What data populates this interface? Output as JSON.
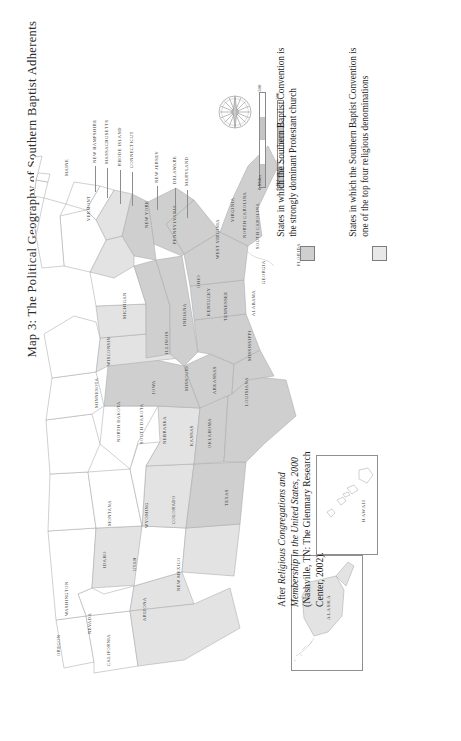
{
  "title": {
    "prefix": "Map 3:",
    "text": "The Political Geography of Southern Baptist Adherents",
    "full": "Map 3: The Political Geography of Southern Baptist Adherents"
  },
  "legend": {
    "items": [
      {
        "swatch_color": "#cfcfcf",
        "label": "States in which the Southern Baptist Convention is the strongly dominant Protestant church"
      },
      {
        "swatch_color": "#e8e8e8",
        "label": "States in which the Southern Baptist Convention is one of the top four religious denominations"
      }
    ]
  },
  "scale": {
    "miles": {
      "zero": "0 Miles",
      "max": "500"
    },
    "kilometers": {
      "zero": "0 Kilometers",
      "max": "500"
    }
  },
  "compass": {
    "name": "compass-rose"
  },
  "insets": [
    {
      "id": "alaska",
      "label": "Alaska"
    },
    {
      "id": "hawaii",
      "label": "Hawaii"
    }
  ],
  "source": {
    "line1_prefix": "After ",
    "line1_italic": "Religious Congregations and Membership in the United States, 2000",
    "line2": " (Nashville, TN: The Glenmary Research Center, 2002)."
  },
  "map_data": {
    "type": "choropleth",
    "region": "United States",
    "classes": [
      {
        "name": "strongly-dominant",
        "color": "#cfcfcf"
      },
      {
        "name": "top-four-denomination",
        "color": "#e3e3e3"
      },
      {
        "name": "none",
        "color": "#ffffff"
      }
    ],
    "states": [
      {
        "name": "Washington",
        "class": "none"
      },
      {
        "name": "Oregon",
        "class": "none"
      },
      {
        "name": "Idaho",
        "class": "none"
      },
      {
        "name": "Montana",
        "class": "none"
      },
      {
        "name": "Wyoming",
        "class": "top-four-denomination"
      },
      {
        "name": "Nevada",
        "class": "top-four-denomination"
      },
      {
        "name": "California",
        "class": "top-four-denomination"
      },
      {
        "name": "Utah",
        "class": "none"
      },
      {
        "name": "Arizona",
        "class": "top-four-denomination"
      },
      {
        "name": "Colorado",
        "class": "top-four-denomination"
      },
      {
        "name": "New Mexico",
        "class": "strongly-dominant"
      },
      {
        "name": "North Dakota",
        "class": "none"
      },
      {
        "name": "South Dakota",
        "class": "none"
      },
      {
        "name": "Nebraska",
        "class": "none"
      },
      {
        "name": "Kansas",
        "class": "top-four-denomination"
      },
      {
        "name": "Oklahoma",
        "class": "strongly-dominant"
      },
      {
        "name": "Texas",
        "class": "strongly-dominant"
      },
      {
        "name": "Minnesota",
        "class": "none"
      },
      {
        "name": "Iowa",
        "class": "none"
      },
      {
        "name": "Missouri",
        "class": "strongly-dominant"
      },
      {
        "name": "Arkansas",
        "class": "strongly-dominant"
      },
      {
        "name": "Louisiana",
        "class": "strongly-dominant"
      },
      {
        "name": "Wisconsin",
        "class": "none"
      },
      {
        "name": "Illinois",
        "class": "top-four-denomination"
      },
      {
        "name": "Michigan",
        "class": "none"
      },
      {
        "name": "Indiana",
        "class": "top-four-denomination"
      },
      {
        "name": "Ohio",
        "class": "none"
      },
      {
        "name": "Kentucky",
        "class": "strongly-dominant"
      },
      {
        "name": "Tennessee",
        "class": "strongly-dominant"
      },
      {
        "name": "Mississippi",
        "class": "strongly-dominant"
      },
      {
        "name": "Alabama",
        "class": "strongly-dominant"
      },
      {
        "name": "Georgia",
        "class": "strongly-dominant"
      },
      {
        "name": "Florida",
        "class": "strongly-dominant"
      },
      {
        "name": "South Carolina",
        "class": "strongly-dominant"
      },
      {
        "name": "North Carolina",
        "class": "strongly-dominant"
      },
      {
        "name": "Virginia",
        "class": "strongly-dominant"
      },
      {
        "name": "West Virginia",
        "class": "top-four-denomination"
      },
      {
        "name": "Maryland",
        "class": "top-four-denomination"
      },
      {
        "name": "Delaware",
        "class": "none"
      },
      {
        "name": "Pennsylvania",
        "class": "none"
      },
      {
        "name": "New Jersey",
        "class": "none"
      },
      {
        "name": "New York",
        "class": "none"
      },
      {
        "name": "Connecticut",
        "class": "none"
      },
      {
        "name": "Rhode Island",
        "class": "none"
      },
      {
        "name": "Massachusetts",
        "class": "none"
      },
      {
        "name": "Vermont",
        "class": "none"
      },
      {
        "name": "New Hampshire",
        "class": "none"
      },
      {
        "name": "Maine",
        "class": "none"
      },
      {
        "name": "Alaska",
        "class": "top-four-denomination"
      },
      {
        "name": "Hawaii",
        "class": "none"
      }
    ],
    "labels": [
      {
        "name": "Washington",
        "x": 30,
        "y": 600,
        "size": "sm"
      },
      {
        "name": "Oregon",
        "x": 22,
        "y": 640,
        "size": "sm"
      },
      {
        "name": "Idaho",
        "x": 68,
        "y": 552,
        "size": "sm"
      },
      {
        "name": "Montana",
        "x": 73,
        "y": 510,
        "size": "sm"
      },
      {
        "name": "Wyoming",
        "x": 110,
        "y": 512,
        "size": "sm"
      },
      {
        "name": "Nevada",
        "x": 53,
        "y": 618,
        "size": "sm"
      },
      {
        "name": "California",
        "x": 72,
        "y": 650,
        "size": "sm"
      },
      {
        "name": "Utah",
        "x": 98,
        "y": 555,
        "size": "sm"
      },
      {
        "name": "Arizona",
        "x": 108,
        "y": 605,
        "size": "sm"
      },
      {
        "name": "Colorado",
        "x": 137,
        "y": 508,
        "size": "sm"
      },
      {
        "name": "New Mexico",
        "x": 142,
        "y": 575,
        "size": "sm"
      },
      {
        "name": "North Dakota",
        "x": 82,
        "y": 426,
        "size": "sm"
      },
      {
        "name": "South Dakota",
        "x": 105,
        "y": 428,
        "size": "sm"
      },
      {
        "name": "Nebraska",
        "x": 128,
        "y": 428,
        "size": "sm"
      },
      {
        "name": "Kansas",
        "x": 155,
        "y": 430,
        "size": "sm"
      },
      {
        "name": "Oklahoma",
        "x": 173,
        "y": 432,
        "size": "sm"
      },
      {
        "name": "Texas",
        "x": 190,
        "y": 490,
        "size": "sm"
      },
      {
        "name": "Minnesota",
        "x": 60,
        "y": 392,
        "size": "sm"
      },
      {
        "name": "Iowa",
        "x": 117,
        "y": 378,
        "size": "sm"
      },
      {
        "name": "Missouri",
        "x": 150,
        "y": 375,
        "size": "sm"
      },
      {
        "name": "Arkansas",
        "x": 178,
        "y": 378,
        "size": "sm"
      },
      {
        "name": "Louisiana",
        "x": 210,
        "y": 390,
        "size": "sm"
      },
      {
        "name": "Wisconsin",
        "x": 72,
        "y": 350,
        "size": "sm"
      },
      {
        "name": "Illinois",
        "x": 130,
        "y": 338,
        "size": "sm"
      },
      {
        "name": "Michigan",
        "x": 88,
        "y": 303,
        "size": "sm"
      },
      {
        "name": "Indiana",
        "x": 148,
        "y": 310,
        "size": "sm"
      },
      {
        "name": "Ohio",
        "x": 162,
        "y": 272,
        "size": "sm"
      },
      {
        "name": "Kentucky",
        "x": 172,
        "y": 300,
        "size": "sm"
      },
      {
        "name": "Tennessee",
        "x": 189,
        "y": 305,
        "size": "sm"
      },
      {
        "name": "Mississippi",
        "x": 213,
        "y": 345,
        "size": "sm"
      },
      {
        "name": "Alabama",
        "x": 217,
        "y": 300,
        "size": "sm"
      },
      {
        "name": "Georgia",
        "x": 227,
        "y": 268,
        "size": "sm"
      },
      {
        "name": "Florida",
        "x": 262,
        "y": 250,
        "size": "sm"
      },
      {
        "name": "South Carolina",
        "x": 221,
        "y": 233,
        "size": "sm"
      },
      {
        "name": "North Carolina",
        "x": 208,
        "y": 222,
        "size": "sm"
      },
      {
        "name": "Virginia",
        "x": 196,
        "y": 206,
        "size": "sm"
      },
      {
        "name": "West Virginia",
        "x": 181,
        "y": 243,
        "size": "sm"
      },
      {
        "name": "Maryland",
        "x": 150,
        "y": 170,
        "size": "sm"
      },
      {
        "name": "Delaware",
        "x": 138,
        "y": 168,
        "size": "sm"
      },
      {
        "name": "Pennsylvania",
        "x": 138,
        "y": 228,
        "size": "sm"
      },
      {
        "name": "New Jersey",
        "x": 120,
        "y": 167,
        "size": "sm"
      },
      {
        "name": "New York",
        "x": 110,
        "y": 212,
        "size": "sm"
      },
      {
        "name": "Connecticut",
        "x": 95,
        "y": 152,
        "size": "sm"
      },
      {
        "name": "Rhode Island",
        "x": 83,
        "y": 150,
        "size": "sm"
      },
      {
        "name": "Massachusetts",
        "x": 70,
        "y": 148,
        "size": "sm"
      },
      {
        "name": "Vermont",
        "x": 52,
        "y": 205,
        "size": "sm"
      },
      {
        "name": "New Hampshire",
        "x": 58,
        "y": 147,
        "size": "sm"
      },
      {
        "name": "Maine",
        "x": 30,
        "y": 160,
        "size": "sm"
      }
    ]
  }
}
